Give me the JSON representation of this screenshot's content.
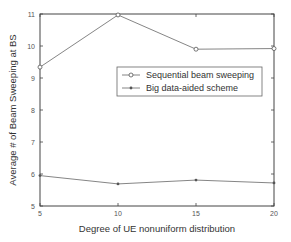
{
  "chart_data": {
    "type": "line",
    "title": "",
    "xlabel": "Degree of UE nonuniform distribution",
    "ylabel": "Average # of Beam Sweeping at BS",
    "x": [
      5,
      10,
      15,
      20
    ],
    "xlim": [
      5,
      20
    ],
    "ylim": [
      5,
      11
    ],
    "xticks": [
      5,
      10,
      15,
      20
    ],
    "yticks": [
      5,
      6,
      7,
      8,
      9,
      10,
      11
    ],
    "grid": false,
    "legend_position": "center-right",
    "series": [
      {
        "name": "Sequential beam sweeping",
        "marker": "circle",
        "values": [
          9.34,
          10.97,
          9.9,
          9.92
        ]
      },
      {
        "name": "Big data-aided scheme",
        "marker": "dot",
        "values": [
          5.95,
          5.69,
          5.81,
          5.72
        ]
      }
    ]
  },
  "colors": {
    "axis": "#444444",
    "line": "#777777",
    "text": "#333333"
  }
}
